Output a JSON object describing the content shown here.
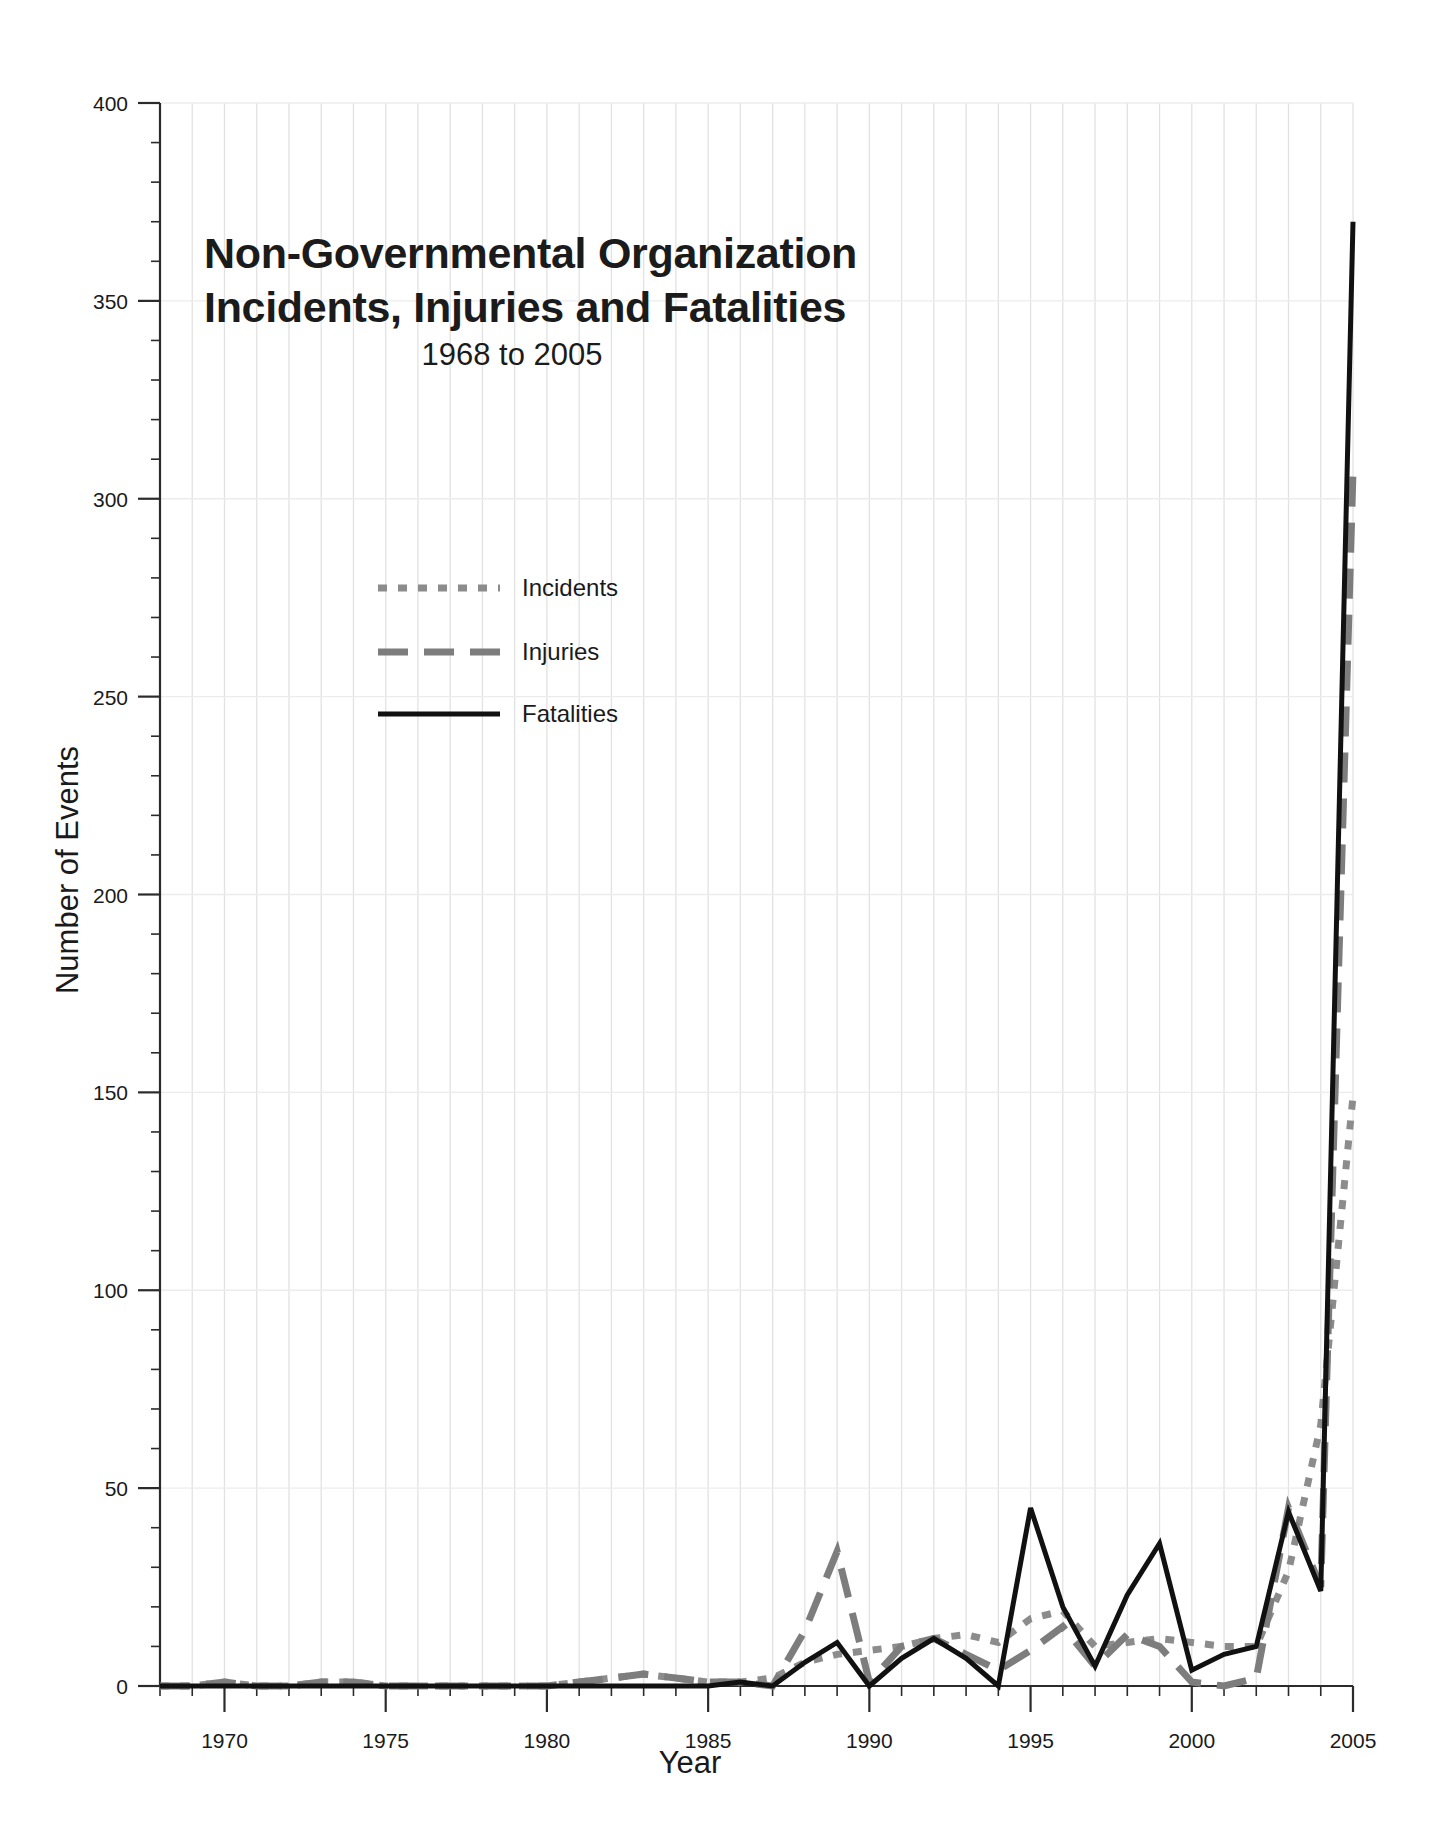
{
  "chart_data": {
    "type": "line",
    "title": "Non-Governmental Organization Incidents, Injuries and Fatalities",
    "title_line1": "Non-Governmental Organization",
    "title_line2": "Incidents, Injuries and Fatalities",
    "subtitle": "1968 to 2005",
    "xlabel": "Year",
    "ylabel": "Number of Events",
    "xlim": [
      1968,
      2005
    ],
    "ylim": [
      0,
      400
    ],
    "grid": true,
    "grid_vertical_every_years": 1,
    "grid_horizontal_at": [
      50,
      100,
      150,
      200,
      250,
      300,
      350,
      400
    ],
    "legend_position": "upper-left-inside",
    "ytick_labels": [
      "0",
      "50",
      "100",
      "150",
      "200",
      "250",
      "300",
      "350",
      "400"
    ],
    "ytick_values": [
      0,
      50,
      100,
      150,
      200,
      250,
      300,
      350,
      400
    ],
    "yminor_step": 10,
    "ymid_step": 25,
    "xtick_labels": [
      "1970",
      "1975",
      "1980",
      "1985",
      "1990",
      "1995",
      "2000",
      "2005"
    ],
    "xtick_values": [
      1970,
      1975,
      1980,
      1985,
      1990,
      1995,
      2000,
      2005
    ],
    "xminor_step": 1,
    "x": [
      1968,
      1969,
      1970,
      1971,
      1972,
      1973,
      1974,
      1975,
      1976,
      1977,
      1978,
      1979,
      1980,
      1981,
      1982,
      1983,
      1984,
      1985,
      1986,
      1987,
      1988,
      1989,
      1990,
      1991,
      1992,
      1993,
      1994,
      1995,
      1996,
      1997,
      1998,
      1999,
      2000,
      2001,
      2002,
      2003,
      2004,
      2005
    ],
    "series": [
      {
        "name": "Incidents",
        "line_style": "dotted",
        "color": "#8c8c8c",
        "values": [
          0,
          0,
          1,
          0,
          0,
          1,
          1,
          0,
          0,
          0,
          0,
          0,
          0,
          1,
          2,
          3,
          2,
          1,
          1,
          2,
          6,
          8,
          9,
          10,
          12,
          13,
          11,
          17,
          19,
          10,
          11,
          12,
          11,
          10,
          10,
          29,
          66,
          149
        ]
      },
      {
        "name": "Injuries",
        "line_style": "dashed",
        "color": "#7d7d7d",
        "values": [
          0,
          0,
          1,
          0,
          0,
          1,
          1,
          0,
          0,
          0,
          0,
          0,
          0,
          1,
          2,
          3,
          2,
          1,
          1,
          0,
          14,
          34,
          1,
          10,
          12,
          8,
          4,
          9,
          15,
          5,
          13,
          10,
          1,
          0,
          2,
          45,
          25,
          307
        ]
      },
      {
        "name": "Fatalities",
        "line_style": "solid",
        "color": "#111111",
        "values": [
          0,
          0,
          0,
          0,
          0,
          0,
          0,
          0,
          0,
          0,
          0,
          0,
          0,
          0,
          0,
          0,
          0,
          0,
          1,
          0,
          6,
          11,
          0,
          7,
          12,
          7,
          0,
          45,
          20,
          5,
          23,
          36,
          4,
          8,
          10,
          44,
          24,
          370
        ]
      }
    ]
  },
  "legend": {
    "items": [
      {
        "label": "Incidents"
      },
      {
        "label": "Injuries"
      },
      {
        "label": "Fatalities"
      }
    ]
  }
}
